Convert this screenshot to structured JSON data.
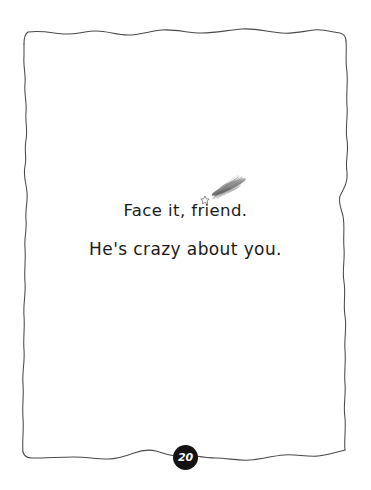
{
  "page": {
    "background_color": "#ffffff",
    "ink_color": "#3a3a3a",
    "text_color": "#1b1b1b",
    "page_number": "20",
    "page_number_badge_color": "#131313",
    "page_number_text_color": "#ffffff"
  },
  "caption": {
    "line1": "Face it, friend.",
    "line2": "He's crazy about you."
  },
  "decorations": {
    "smudge_name": "pencil-smudge-shooting-star",
    "frame_name": "hand-drawn-page-border"
  }
}
